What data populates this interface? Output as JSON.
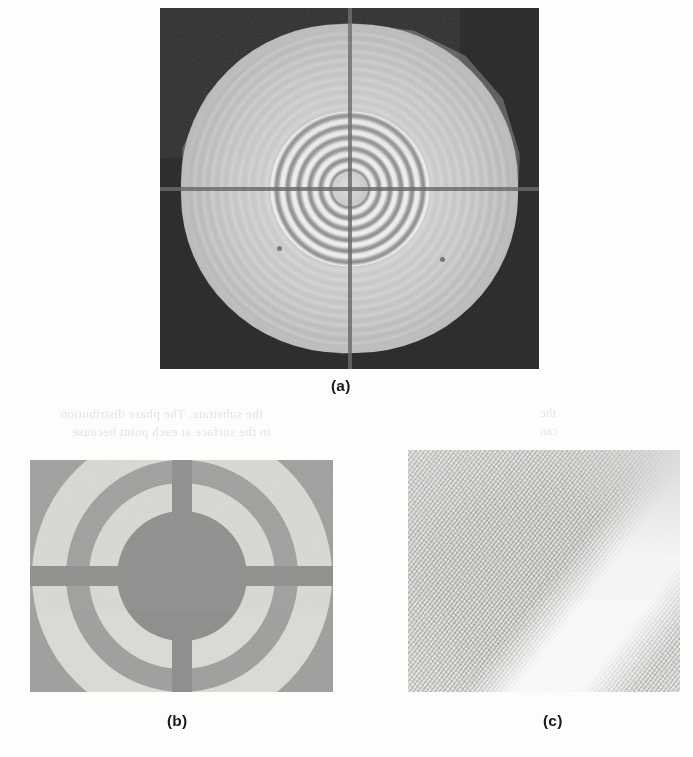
{
  "page": {
    "background_color": "#fdfdfc",
    "width": 693,
    "height": 757,
    "kind": "journal-figure-scan"
  },
  "figure": {
    "panels": [
      {
        "id": "a",
        "caption": "(a)",
        "name": "dark-field-micrograph",
        "description": "Low-magnification micrograph of a circular specimen showing concentric Fresnel diffraction rings and a crosshair support grid on a dark background",
        "frame": {
          "x": 160,
          "y": 8,
          "width": 379,
          "height": 361
        },
        "colors": {
          "background": "#2e2e2e",
          "disc_bright": "#d6d6d6",
          "disc_edge": "#5c5c5c",
          "crosshair": "#6a6a6a"
        },
        "features": {
          "shape": "polygonal disc",
          "ring_count_core": 7,
          "crosshair": "vertical and horizontal support bars through centre",
          "central_hub": "bright solid core"
        }
      },
      {
        "id": "b",
        "caption": "(b)",
        "name": "zone-plate-mask-closeup",
        "description": "Enlarged view of the concentric annular mask with four radial support spokes separating the rings",
        "frame": {
          "x": 30,
          "y": 460,
          "width": 303,
          "height": 232
        },
        "colors": {
          "background": "#a0a09e",
          "ring_bright": "#d9d9d6",
          "ring_dark": "#8f8f8d"
        },
        "features": {
          "ring_count": 3,
          "spoke_count": 4,
          "spoke_orientation": "vertical and horizontal cross"
        }
      },
      {
        "id": "c",
        "caption": "(c)",
        "name": "lattice-fringe-image",
        "description": "High-resolution lattice fringe image showing diagonal atomic planes with a bright amorphous band crossing the upper right",
        "frame": {
          "x": 408,
          "y": 450,
          "width": 272,
          "height": 242
        },
        "colors": {
          "background": "#c9c9c7",
          "fringe_dark": "#969694",
          "fringe_light": "#ececea",
          "band_bright": "#fcfcfb"
        },
        "features": {
          "fringe_angle_deg": 128,
          "secondary_fringe_angle_deg": 38,
          "bright_band": "diagonal, upper right"
        }
      }
    ],
    "captions": [
      {
        "label": "(a)",
        "x": 331,
        "y": 377
      },
      {
        "label": "(b)",
        "x": 167,
        "y": 712
      },
      {
        "label": "(c)",
        "x": 543,
        "y": 712
      }
    ]
  },
  "showthrough": {
    "note": "faint mirrored text bleeding through from the reverse side of the printed page",
    "lines": [
      {
        "text": "the substrate. The phase distribution",
        "x": 60,
        "y": 406,
        "size": 13
      },
      {
        "text": "in the surface at each point because",
        "x": 72,
        "y": 424,
        "size": 13
      },
      {
        "text": "the",
        "x": 540,
        "y": 406,
        "size": 12
      },
      {
        "text": "can",
        "x": 540,
        "y": 424,
        "size": 12
      }
    ]
  }
}
